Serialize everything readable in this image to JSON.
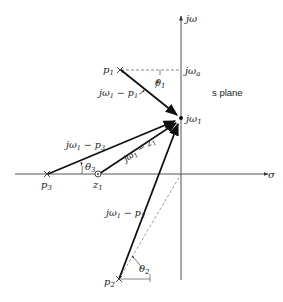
{
  "diagram": {
    "title": "s plane",
    "axes": {
      "imag_label": "jω",
      "real_label": "σ"
    },
    "points": {
      "jw1": {
        "label": "jω",
        "sub": "1"
      },
      "jwa": {
        "label": "jω",
        "sub": "a"
      },
      "p1": {
        "label": "p",
        "sub": "1"
      },
      "p2": {
        "label": "p",
        "sub": "2"
      },
      "p3": {
        "label": "p",
        "sub": "3"
      },
      "z1": {
        "label": "z",
        "sub": "1"
      }
    },
    "vectors": {
      "v_p1": {
        "a": "jω",
        "a_sub": "1",
        "op": " − ",
        "b": "p",
        "b_sub": "1"
      },
      "v_p2": {
        "a": "jω",
        "a_sub": "1",
        "op": " − ",
        "b": "p",
        "b_sub": "2"
      },
      "v_p3": {
        "a": "jω",
        "a_sub": "1",
        "op": " − ",
        "b": "p",
        "b_sub": "3"
      },
      "v_z1": {
        "a": "jω",
        "a_sub": "1",
        "op": " − ",
        "b": "z",
        "b_sub": "1"
      }
    },
    "angles": {
      "theta1": {
        "label": "θ",
        "sub": "1"
      },
      "theta2": {
        "label": "θ",
        "sub": "2"
      },
      "theta3": {
        "label": "θ",
        "sub": "3"
      }
    },
    "colors": {
      "ink": "#222222",
      "axis": "#555555",
      "dashed": "#666666"
    }
  }
}
